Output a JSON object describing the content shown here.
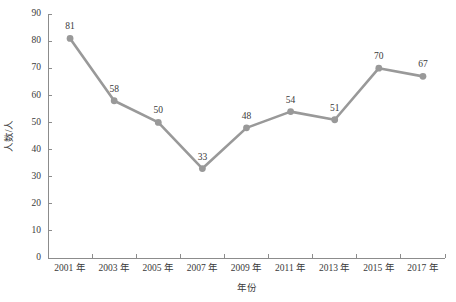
{
  "chart_data": {
    "type": "line",
    "title": "",
    "subtitle": "",
    "xlabel": "年份",
    "ylabel": "人数/人",
    "categories": [
      "2001 年",
      "2003 年",
      "2005 年",
      "2007 年",
      "2009 年",
      "2011 年",
      "2013 年",
      "2015 年",
      "2017 年"
    ],
    "values": [
      81,
      58,
      50,
      33,
      48,
      54,
      51,
      70,
      67
    ],
    "point_labels": [
      "81",
      "58",
      "50",
      "33",
      "48",
      "54",
      "51",
      "70",
      "67"
    ],
    "ylim": [
      0,
      90
    ],
    "ytick_step": 10,
    "ytick_labels": [
      "0",
      "10",
      "20",
      "30",
      "40",
      "50",
      "60",
      "70",
      "80",
      "90"
    ],
    "grid": false,
    "legend": "none",
    "series": [
      {
        "name": "人数",
        "values": [
          81,
          58,
          50,
          33,
          48,
          54,
          51,
          70,
          67
        ],
        "color": "#999999",
        "marker": "circle"
      }
    ],
    "colors": {
      "line": "#999999",
      "marker": "#999999",
      "axis": "#8c8c8c",
      "text": "#3a3a3a",
      "background": "#ffffff"
    }
  }
}
